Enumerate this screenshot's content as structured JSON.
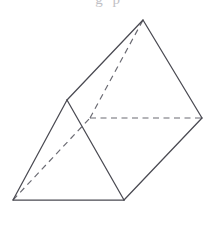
{
  "figure": {
    "caption_fragment": "g  p",
    "colors": {
      "background": "#ffffff",
      "visible_edge": "#4a4a52",
      "hidden_edge": "#6b6b73",
      "face": "#ffffff"
    },
    "canvas": {
      "width": 218,
      "height": 227
    },
    "vertices": {
      "A": {
        "name": "front-bottom-left",
        "x": 13,
        "y": 200,
        "visible": true
      },
      "B": {
        "name": "front-bottom-right",
        "x": 124,
        "y": 200,
        "visible": true
      },
      "C": {
        "name": "front-apex",
        "x": 67,
        "y": 100,
        "visible": true
      },
      "D": {
        "name": "back-bottom-left",
        "x": 90,
        "y": 118,
        "visible": false
      },
      "E": {
        "name": "back-bottom-right",
        "x": 202,
        "y": 118,
        "visible": true
      },
      "F": {
        "name": "back-apex",
        "x": 143,
        "y": 20,
        "visible": true
      }
    },
    "edges": [
      {
        "id": "AB",
        "from": "A",
        "to": "B",
        "style": "solid",
        "label": "front-base-edge"
      },
      {
        "id": "AC",
        "from": "A",
        "to": "C",
        "style": "solid",
        "label": "front-left-edge"
      },
      {
        "id": "BC",
        "from": "B",
        "to": "C",
        "style": "solid",
        "label": "front-right-edge"
      },
      {
        "id": "CF",
        "from": "C",
        "to": "F",
        "style": "solid",
        "label": "top-lateral-edge"
      },
      {
        "id": "BE",
        "from": "B",
        "to": "E",
        "style": "solid",
        "label": "lower-lateral-edge"
      },
      {
        "id": "FE",
        "from": "F",
        "to": "E",
        "style": "solid",
        "label": "back-right-edge"
      },
      {
        "id": "AD",
        "from": "A",
        "to": "D",
        "style": "dashed",
        "label": "hidden-lateral-edge"
      },
      {
        "id": "DE",
        "from": "D",
        "to": "E",
        "style": "dashed",
        "label": "hidden-base-edge"
      },
      {
        "id": "DF",
        "from": "D",
        "to": "F",
        "style": "dashed",
        "label": "hidden-back-left-edge"
      }
    ],
    "faces": [
      {
        "id": "front-triangle",
        "vertices": [
          "A",
          "B",
          "C"
        ],
        "visible": true
      },
      {
        "id": "top-lateral-face",
        "vertices": [
          "A",
          "C",
          "F"
        ],
        "visible": true
      },
      {
        "id": "right-lateral-face",
        "vertices": [
          "C",
          "F",
          "E",
          "B"
        ],
        "visible": true
      },
      {
        "id": "back-triangle",
        "vertices": [
          "D",
          "E",
          "F"
        ],
        "visible": false
      }
    ]
  }
}
